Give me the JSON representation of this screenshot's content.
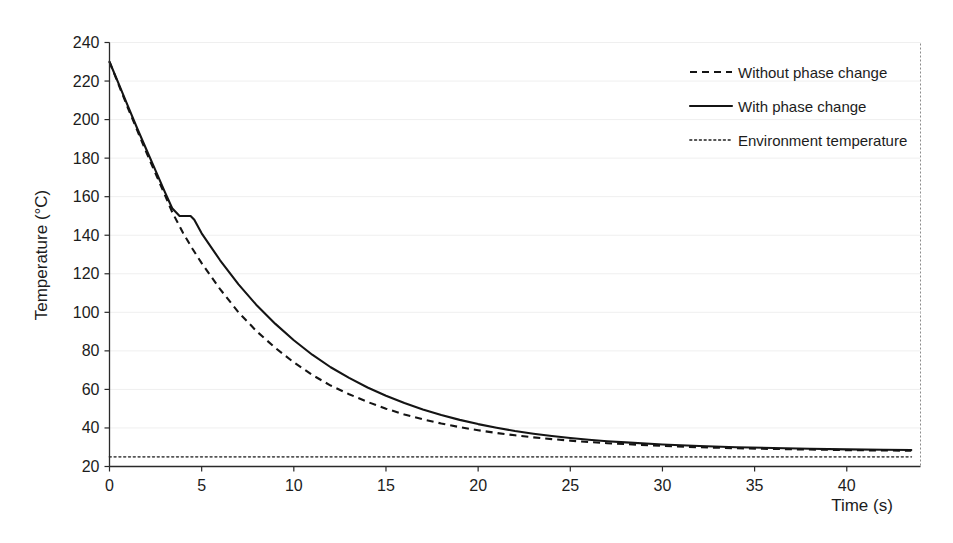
{
  "chart_data": {
    "type": "line",
    "title": "",
    "xlabel": "Time (s)",
    "ylabel": "Temperature (°C)",
    "xlim": [
      0,
      44
    ],
    "ylim": [
      20,
      240
    ],
    "xticks": [
      0,
      5,
      10,
      15,
      20,
      25,
      30,
      35,
      40
    ],
    "yticks": [
      20,
      40,
      60,
      80,
      100,
      120,
      140,
      160,
      180,
      200,
      220,
      240
    ],
    "xtick_labels": [
      "0",
      "5",
      "10",
      "15",
      "20",
      "25",
      "30",
      "35",
      "40"
    ],
    "ytick_labels": [
      "20",
      "40",
      "60",
      "80",
      "100",
      "120",
      "140",
      "160",
      "180",
      "200",
      "220",
      "240"
    ],
    "grid": true,
    "grid_axis": "y",
    "legend_position": "upper right",
    "series": [
      {
        "name": "Without phase change",
        "style": "dashed",
        "color": "#141414",
        "x": [
          0,
          0.5,
          1,
          1.5,
          2,
          2.5,
          3,
          3.4,
          4,
          4.5,
          5,
          6,
          7,
          8,
          9,
          10,
          11,
          12,
          13,
          14,
          15,
          16,
          17,
          18,
          19,
          20,
          21,
          22,
          23,
          24,
          25,
          26,
          27,
          28,
          30,
          32,
          34,
          36,
          38,
          40,
          42,
          43.5
        ],
        "y": [
          230,
          218,
          206,
          194.5,
          183,
          172,
          161,
          152,
          141,
          133,
          125.5,
          112,
          100,
          90,
          81.5,
          74,
          67.5,
          62,
          57.5,
          53.5,
          50,
          47,
          44.5,
          42.3,
          40.4,
          38.8,
          37.4,
          36.2,
          35.1,
          34.2,
          33.4,
          32.7,
          32.1,
          31.6,
          30.7,
          30.0,
          29.5,
          29.1,
          28.8,
          28.5,
          28.3,
          28.2
        ]
      },
      {
        "name": "With phase change",
        "style": "solid",
        "color": "#141414",
        "x": [
          0,
          0.5,
          1,
          1.5,
          2,
          2.5,
          3,
          3.4,
          3.8,
          4.4,
          4.6,
          5,
          6,
          7,
          8,
          9,
          10,
          11,
          12,
          13,
          14,
          15,
          16,
          17,
          18,
          19,
          20,
          21,
          22,
          23,
          24,
          25,
          26,
          27,
          28,
          30,
          32,
          34,
          36,
          38,
          40,
          42,
          43.5
        ],
        "y": [
          230,
          218.5,
          207,
          195.5,
          184.5,
          173.5,
          162.5,
          154,
          150,
          150,
          148,
          141,
          127,
          114.5,
          103.5,
          94,
          85.5,
          78,
          71.5,
          66,
          61,
          56.7,
          52.9,
          49.6,
          46.7,
          44.2,
          42.0,
          40.1,
          38.4,
          37.0,
          35.8,
          34.8,
          33.9,
          33.1,
          32.5,
          31.4,
          30.6,
          30.0,
          29.6,
          29.2,
          28.9,
          28.7,
          28.6
        ]
      },
      {
        "name": "Environment temperature",
        "style": "dotted",
        "color": "#555555",
        "x": [
          0,
          43.5
        ],
        "y": [
          25,
          25
        ]
      }
    ],
    "annotations": {
      "phase_change_plateau_temperature": 150,
      "phase_change_start_time": 3.8,
      "phase_change_end_time": 4.5,
      "initial_temperature": 230,
      "environment_temperature": 25
    }
  },
  "legend": {
    "entries": [
      {
        "label": "Without phase change",
        "style": "dashed"
      },
      {
        "label": "With phase change",
        "style": "solid"
      },
      {
        "label": "Environment temperature",
        "style": "dotted"
      }
    ]
  },
  "axes": {
    "y_title": "Temperature (°C)",
    "x_title": "Time (s)"
  }
}
